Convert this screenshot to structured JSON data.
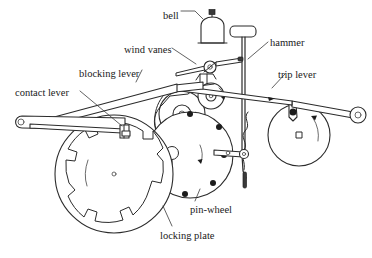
{
  "figure": {
    "kind": "technical-line-diagram",
    "background_color": "#ffffff",
    "line_color": "#2b2b2b"
  },
  "labels": [
    {
      "id": "bell",
      "text": "bell",
      "x": 163,
      "y": 11
    },
    {
      "id": "wind-vanes",
      "text": "wind vanes",
      "x": 124,
      "y": 45
    },
    {
      "id": "hammer",
      "text": "hammer",
      "x": 270,
      "y": 38
    },
    {
      "id": "blocking-lever",
      "text": "blocking lever",
      "x": 79,
      "y": 69
    },
    {
      "id": "trip-lever",
      "text": "trip lever",
      "x": 278,
      "y": 70
    },
    {
      "id": "contact-lever",
      "text": "contact lever",
      "x": 15,
      "y": 88
    },
    {
      "id": "pin-wheel",
      "text": "pin-wheel",
      "x": 190,
      "y": 205
    },
    {
      "id": "locking-plate",
      "text": "locking plate",
      "x": 160,
      "y": 231
    }
  ],
  "parts": {
    "bell": {
      "name": "bell",
      "shape": "dome with knob"
    },
    "hammer": {
      "name": "hammer",
      "shape": "rod with rectangular head"
    },
    "wind_vanes": {
      "name": "wind vanes",
      "shape": "horizontal fly vanes on hub"
    },
    "blocking_lever": {
      "name": "blocking lever",
      "shape": "long tapered arm"
    },
    "contact_lever": {
      "name": "contact lever",
      "shape": "long arm with eye end"
    },
    "trip_lever": {
      "name": "trip lever",
      "shape": "long arm with eye end"
    },
    "pin_wheel": {
      "name": "pin-wheel",
      "shape": "disc with pins",
      "pin_count": 7
    },
    "locking_plate": {
      "name": "locking plate",
      "shape": "notched ring disc",
      "notch_count": 12
    },
    "trip_wheel": {
      "name": "trip wheel",
      "shape": "disc with square arbor"
    }
  }
}
